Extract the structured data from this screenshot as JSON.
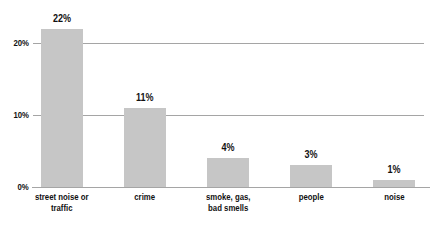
{
  "chart_data": {
    "type": "bar",
    "categories": [
      "street noise or\ntraffic",
      "crime",
      "smoke, gas,\nbad smells",
      "people",
      "noise"
    ],
    "values": [
      22,
      11,
      4,
      3,
      1
    ],
    "value_labels": [
      "22%",
      "11%",
      "4%",
      "3%",
      "1%"
    ],
    "title": "",
    "xlabel": "",
    "ylabel": "",
    "ylim": [
      0,
      25
    ],
    "yticks": [
      0,
      10,
      20
    ],
    "ytick_labels": [
      "0%",
      "10%",
      "20%"
    ],
    "gridlines_at": [
      10,
      20
    ],
    "grid": "horizontal",
    "legend": "none",
    "colors": {
      "bar_fill": "#c6c6c6",
      "gridline": "#a5a5a5",
      "baseline": "#a5a5a5",
      "text": "#111111",
      "background": "#ffffff"
    }
  }
}
